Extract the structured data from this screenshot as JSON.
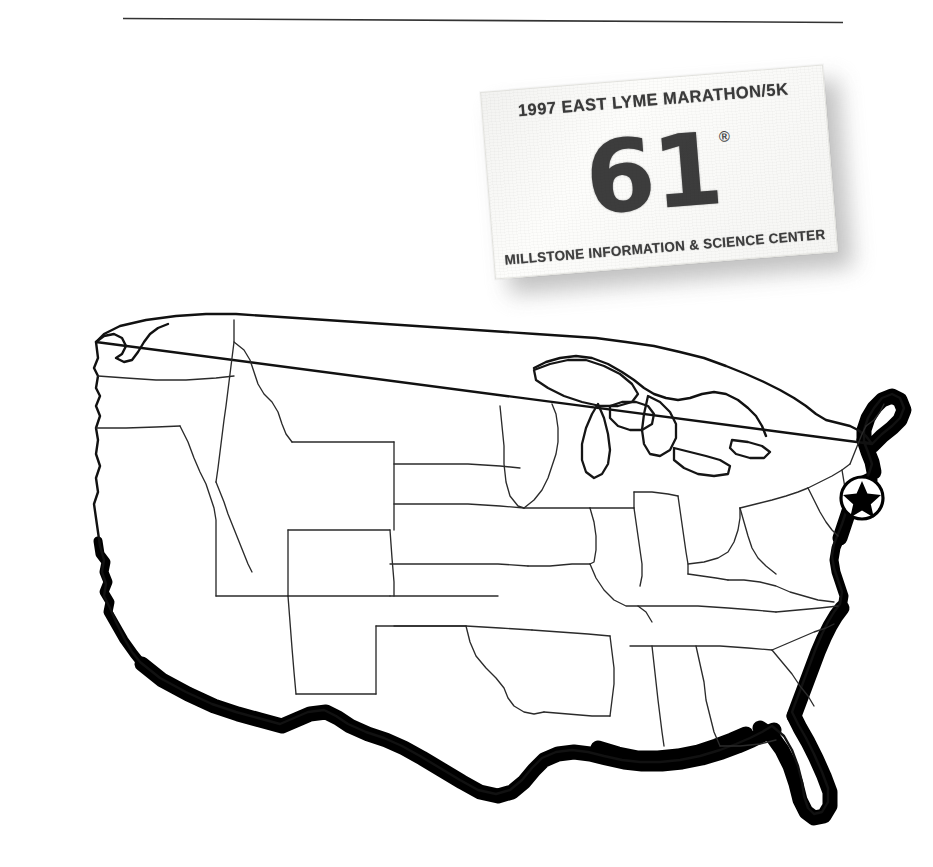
{
  "page": {
    "background_color": "#ffffff",
    "ink_color": "#111111",
    "shadow_color": "#b9b9b9"
  },
  "rule": {
    "name": "horizontal-rule",
    "color": "#333333"
  },
  "bib": {
    "event_title": "1997 EAST LYME MARATHON/5K",
    "number": "61",
    "number_mark": "®",
    "sponsor": "MILLSTONE INFORMATION & SCIENCE CENTER",
    "card_color": "#fdfdfb",
    "text_color": "#3b3b3b",
    "rotation_deg": -4.6
  },
  "map": {
    "name": "united-states-map",
    "region": "Continental United States",
    "outline_color": "#111111",
    "state_border_color": "#2b2b2b",
    "coast_shadow_color": "#000000",
    "marker": {
      "label": "East Lyme, Connecticut",
      "shape": "star-in-circle",
      "fill": "#000000"
    }
  }
}
